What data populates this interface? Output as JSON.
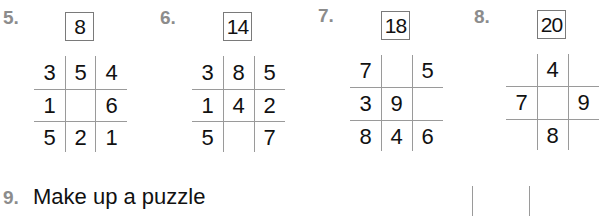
{
  "puzzles": [
    {
      "number": "5.",
      "target": "8",
      "grid": [
        [
          "3",
          "5",
          "4"
        ],
        [
          "1",
          "",
          "6"
        ],
        [
          "5",
          "2",
          "1"
        ]
      ]
    },
    {
      "number": "6.",
      "target": "14",
      "grid": [
        [
          "3",
          "8",
          "5"
        ],
        [
          "1",
          "4",
          "2"
        ],
        [
          "5",
          "",
          "7"
        ]
      ]
    },
    {
      "number": "7.",
      "target": "18",
      "grid": [
        [
          "7",
          "",
          "5"
        ],
        [
          "3",
          "9",
          ""
        ],
        [
          "8",
          "4",
          "6"
        ]
      ]
    },
    {
      "number": "8.",
      "target": "20",
      "grid": [
        [
          "",
          "4",
          ""
        ],
        [
          "7",
          "",
          "9"
        ],
        [
          "",
          "8",
          ""
        ]
      ]
    }
  ],
  "question9": {
    "number": "9.",
    "text": "Make up a puzzle"
  },
  "colors": {
    "label": "#8c8c8c",
    "line": "#9a9a9a",
    "text": "#111111"
  }
}
